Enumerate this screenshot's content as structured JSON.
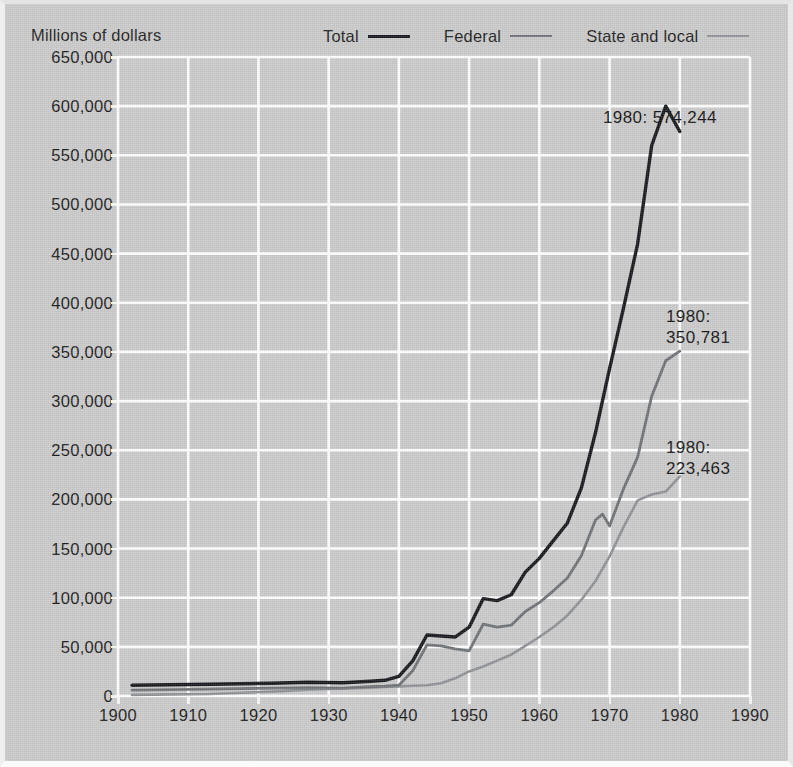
{
  "figure": {
    "background_color": "#c9c9c9",
    "gridline_color": "#ffffff"
  },
  "axis_title": "Millions of dollars",
  "legend": {
    "items": [
      {
        "label": "Total",
        "color": "#14161a",
        "swatch_class": "sw-total"
      },
      {
        "label": "Federal",
        "color": "#6d7074",
        "swatch_class": "sw-federal"
      },
      {
        "label": "State and local",
        "color": "#8d9094",
        "swatch_class": "sw-state"
      }
    ]
  },
  "annotations": [
    {
      "id": "annot-total",
      "text": "1980: 574,244",
      "year": 1980,
      "value": 574244,
      "series": "Total"
    },
    {
      "id": "annot-fed",
      "text": "1980:\n350,781",
      "year": 1980,
      "value": 350781,
      "series": "Federal"
    },
    {
      "id": "annot-state",
      "text": "1980:\n223,463",
      "year": 1980,
      "value": 223463,
      "series": "State and local"
    }
  ],
  "chart_data": {
    "type": "line",
    "title": "",
    "subtitle": "",
    "xlabel": "",
    "ylabel": "Millions of dollars",
    "xlim": [
      1900,
      1990
    ],
    "ylim": [
      0,
      650000
    ],
    "xticks": [
      1900,
      1910,
      1920,
      1930,
      1940,
      1950,
      1960,
      1970,
      1980,
      1990
    ],
    "xtick_labels": [
      "1900",
      "1910",
      "1920",
      "1930",
      "1940",
      "1950",
      "1960",
      "1970",
      "1980",
      "1990"
    ],
    "yticks": [
      0,
      50000,
      100000,
      150000,
      200000,
      250000,
      300000,
      350000,
      400000,
      450000,
      500000,
      550000,
      600000,
      650000
    ],
    "ytick_labels": [
      "0",
      "50,000",
      "100,000",
      "150,000",
      "200,000",
      "250,000",
      "300,000",
      "350,000",
      "400,000",
      "450,000",
      "500,000",
      "550,000",
      "600,000",
      "650,000"
    ],
    "grid": true,
    "grid_color": "#ffffff",
    "legend_position": "top",
    "series": [
      {
        "name": "Total",
        "color": "#14161a",
        "width": 3.4,
        "x": [
          1902,
          1913,
          1922,
          1927,
          1932,
          1936,
          1938,
          1940,
          1942,
          1944,
          1946,
          1948,
          1950,
          1952,
          1954,
          1956,
          1958,
          1960,
          1962,
          1964,
          1966,
          1968,
          1970,
          1972,
          1974,
          1976,
          1978,
          1980
        ],
        "y": [
          11000,
          12000,
          13000,
          14000,
          13500,
          15000,
          16000,
          20000,
          36000,
          62000,
          61000,
          60000,
          70000,
          99000,
          97000,
          103000,
          126000,
          140000,
          158000,
          176000,
          212000,
          268000,
          333000,
          395000,
          460000,
          560000,
          600000,
          574244
        ]
      },
      {
        "name": "Federal",
        "color": "#6d7074",
        "width": 2.8,
        "x": [
          1902,
          1913,
          1922,
          1927,
          1932,
          1936,
          1938,
          1940,
          1942,
          1944,
          1946,
          1948,
          1950,
          1952,
          1954,
          1956,
          1958,
          1960,
          1962,
          1964,
          1966,
          1968,
          1969,
          1970,
          1972,
          1974,
          1976,
          1978,
          1980
        ],
        "y": [
          6000,
          7000,
          8000,
          8500,
          8000,
          9500,
          10000,
          11000,
          26000,
          52000,
          51000,
          48000,
          46000,
          73000,
          70000,
          72000,
          86000,
          95000,
          107000,
          120000,
          143000,
          179000,
          185000,
          173000,
          211000,
          243000,
          305000,
          341000,
          350781
        ]
      },
      {
        "name": "State and local",
        "color": "#8d9094",
        "width": 2.6,
        "x": [
          1902,
          1913,
          1922,
          1927,
          1932,
          1936,
          1938,
          1940,
          1942,
          1944,
          1946,
          1948,
          1950,
          1952,
          1954,
          1956,
          1958,
          1960,
          1962,
          1964,
          1966,
          1968,
          1970,
          1972,
          1974,
          1976,
          1978,
          1980
        ],
        "y": [
          1100,
          2000,
          4500,
          6500,
          7800,
          8500,
          9200,
          9800,
          10500,
          11000,
          13000,
          18000,
          25000,
          30000,
          36000,
          42000,
          51000,
          60000,
          70000,
          82000,
          98000,
          117000,
          142000,
          172000,
          199000,
          205000,
          208000,
          223463
        ]
      }
    ]
  }
}
